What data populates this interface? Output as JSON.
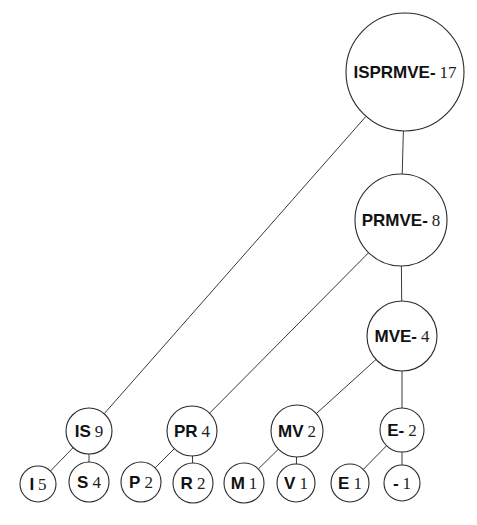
{
  "diagram": {
    "nodes": [
      {
        "id": "ISPRMVE-",
        "symbols": "ISPRMVE-",
        "count": "17",
        "cx": 405,
        "cy": 72,
        "r": 59,
        "size": 17
      },
      {
        "id": "PRMVE-",
        "symbols": "PRMVE-",
        "count": "8",
        "cx": 401,
        "cy": 220,
        "r": 46,
        "size": 17
      },
      {
        "id": "MVE-",
        "symbols": "MVE-",
        "count": "4",
        "cx": 402,
        "cy": 336,
        "r": 35,
        "size": 17
      },
      {
        "id": "IS",
        "symbols": "IS",
        "count": "9",
        "cx": 89,
        "cy": 431,
        "r": 23,
        "size": 17
      },
      {
        "id": "PR",
        "symbols": "PR",
        "count": "4",
        "cx": 192,
        "cy": 431,
        "r": 25,
        "size": 17
      },
      {
        "id": "MV",
        "symbols": "MV",
        "count": "2",
        "cx": 297,
        "cy": 431,
        "r": 26,
        "size": 17
      },
      {
        "id": "E-",
        "symbols": "E-",
        "count": "2",
        "cx": 402,
        "cy": 430,
        "r": 22,
        "size": 17
      },
      {
        "id": "I",
        "symbols": "I",
        "count": "5",
        "cx": 38,
        "cy": 484,
        "r": 18,
        "size": 17
      },
      {
        "id": "S",
        "symbols": "S",
        "count": "4",
        "cx": 89,
        "cy": 482,
        "r": 20,
        "size": 17
      },
      {
        "id": "P",
        "symbols": "P",
        "count": "2",
        "cx": 141,
        "cy": 482,
        "r": 20,
        "size": 17
      },
      {
        "id": "R",
        "symbols": "R",
        "count": "2",
        "cx": 193,
        "cy": 483,
        "r": 20,
        "size": 17
      },
      {
        "id": "M",
        "symbols": "M",
        "count": "1",
        "cx": 244,
        "cy": 483,
        "r": 20,
        "size": 17
      },
      {
        "id": "V",
        "symbols": "V",
        "count": "1",
        "cx": 296,
        "cy": 483,
        "r": 19,
        "size": 17
      },
      {
        "id": "E",
        "symbols": "E",
        "count": "1",
        "cx": 350,
        "cy": 483,
        "r": 19,
        "size": 17
      },
      {
        "id": "-",
        "symbols": "-",
        "count": "1",
        "cx": 402,
        "cy": 483,
        "r": 18,
        "size": 17
      }
    ],
    "edges": [
      {
        "from": "ISPRMVE-",
        "to": "IS"
      },
      {
        "from": "ISPRMVE-",
        "to": "PRMVE-"
      },
      {
        "from": "PRMVE-",
        "to": "PR"
      },
      {
        "from": "PRMVE-",
        "to": "MVE-"
      },
      {
        "from": "MVE-",
        "to": "MV"
      },
      {
        "from": "MVE-",
        "to": "E-"
      },
      {
        "from": "IS",
        "to": "I"
      },
      {
        "from": "IS",
        "to": "S"
      },
      {
        "from": "PR",
        "to": "P"
      },
      {
        "from": "PR",
        "to": "R"
      },
      {
        "from": "MV",
        "to": "M"
      },
      {
        "from": "MV",
        "to": "V"
      },
      {
        "from": "E-",
        "to": "E"
      },
      {
        "from": "E-",
        "to": "-"
      }
    ]
  },
  "colors": {
    "background": "#ffffff",
    "stroke": "#2a2a2a",
    "text": "#111111"
  }
}
